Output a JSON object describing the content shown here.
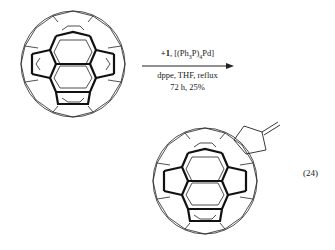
{
  "reaction": {
    "reagents_top_bold": "+1",
    "reagents_top_rest": ", [(Ph",
    "sub3": "3",
    "mid": "P)",
    "sub4": "4",
    "end": "Pd]",
    "conditions_line1": "dppe, THF, reflux",
    "conditions_line2": "72 h, 25%",
    "equation_number": "(24)"
  },
  "structures": {
    "reactant": "C60 fullerene",
    "product": "C60 fullerene with fused methylenecyclopentane ring"
  }
}
